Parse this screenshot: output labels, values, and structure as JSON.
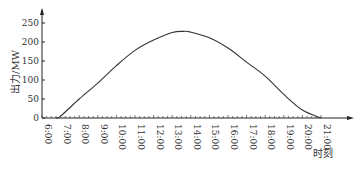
{
  "chart_data": {
    "type": "line",
    "title": "",
    "xlabel": "时刻",
    "ylabel": "出力/MW",
    "ylim": [
      0,
      250
    ],
    "yticks": [
      0,
      50,
      100,
      150,
      200,
      250
    ],
    "xticks": [
      "6:00",
      "7:00",
      "8:00",
      "9:00",
      "10:00",
      "11:00",
      "12:00",
      "13:00",
      "14:00",
      "15:00",
      "16:00",
      "17:00",
      "18:00",
      "19:00",
      "20:00",
      "21:00"
    ],
    "grid": false,
    "legend": null,
    "series": [
      {
        "name": "出力",
        "x": [
          6.75,
          7,
          8,
          9,
          10,
          11,
          12,
          13,
          13.6,
          14,
          15,
          16,
          17,
          18,
          19,
          20,
          21
        ],
        "values": [
          0,
          5,
          50,
          92,
          138,
          178,
          205,
          225,
          228,
          226,
          211,
          184,
          147,
          110,
          62,
          21,
          0
        ]
      }
    ]
  }
}
